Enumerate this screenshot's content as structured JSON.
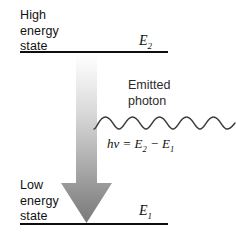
{
  "figure": {
    "background_color": "#ffffff"
  },
  "levels": {
    "upper": {
      "label": "High\nenergy\nstate",
      "symbol": "E",
      "symbol_subscript": "2",
      "line_color": "#0d0d0d"
    },
    "lower": {
      "label": "Low\nenergy\nstate",
      "symbol": "E",
      "symbol_subscript": "1",
      "line_color": "#0d0d0d"
    }
  },
  "arrow": {
    "name": "downward-transition-arrow",
    "direction": "down",
    "gradient_start_color": "#ffffff",
    "gradient_end_color": "#7a7a7a"
  },
  "photon": {
    "label": "Emitted\nphoton",
    "wave_color": "#3c3c3c",
    "cycles": 5,
    "equation": {
      "h": "h",
      "nu": "ν",
      "equals": " = ",
      "e_upper": "E",
      "sub_upper": "2",
      "minus": " − ",
      "e_lower": "E",
      "sub_lower": "1",
      "full": "hν = E2 − E1"
    }
  }
}
